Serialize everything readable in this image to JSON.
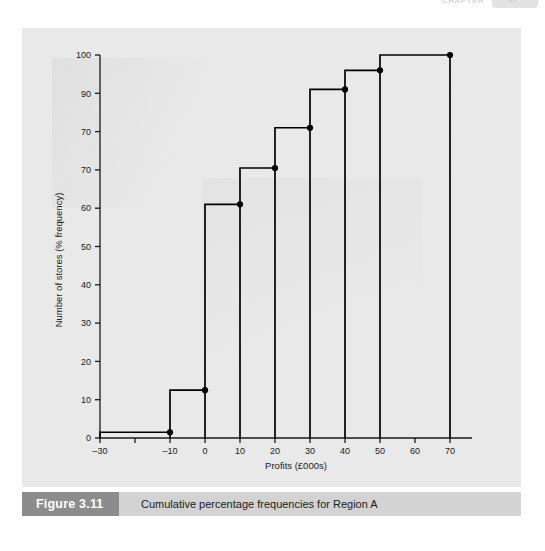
{
  "page_header": {
    "running_head": "CHAPTER",
    "page_number": "97"
  },
  "figure": {
    "badge_label": "Figure 3.11",
    "caption": "Cumulative percentage frequencies for Region A"
  },
  "chart_data": {
    "type": "line",
    "subtype": "step",
    "title": "",
    "xlabel": "Profits (£000s)",
    "ylabel": "Number of stores (% frequency)",
    "xlim": [
      -30,
      70
    ],
    "ylim": [
      0,
      100
    ],
    "xticks": [
      -30,
      -20,
      -10,
      0,
      10,
      20,
      30,
      40,
      50,
      60,
      70
    ],
    "xticklabels": [
      "–30",
      "",
      "–10",
      "0",
      "10",
      "20",
      "30",
      "40",
      "50",
      "60",
      "70"
    ],
    "yticks": [
      0,
      10,
      20,
      30,
      40,
      50,
      60,
      70,
      80,
      90,
      100
    ],
    "yticklabels": [
      "0",
      "10",
      "20",
      "30",
      "40",
      "50",
      "60",
      "70",
      "70",
      "90",
      "100"
    ],
    "grid": false,
    "legend": null,
    "line_color": "#000000",
    "marker": "circle",
    "marker_color": "#000000",
    "steps": [
      {
        "x_start": -30,
        "x_end": -10,
        "y": 1.5
      },
      {
        "x_start": -10,
        "x_end": 0,
        "y": 12.5
      },
      {
        "x_start": 0,
        "x_end": 10,
        "y": 61
      },
      {
        "x_start": 10,
        "x_end": 20,
        "y": 70.5
      },
      {
        "x_start": 20,
        "x_end": 30,
        "y": 81
      },
      {
        "x_start": 30,
        "x_end": 40,
        "y": 91
      },
      {
        "x_start": 40,
        "x_end": 50,
        "y": 96
      },
      {
        "x_start": 50,
        "x_end": 70,
        "y": 100
      }
    ],
    "points": [
      {
        "x": -10,
        "y": 1.5
      },
      {
        "x": 0,
        "y": 12.5
      },
      {
        "x": 10,
        "y": 61
      },
      {
        "x": 20,
        "y": 70.5
      },
      {
        "x": 30,
        "y": 81
      },
      {
        "x": 40,
        "y": 91
      },
      {
        "x": 50,
        "y": 96
      },
      {
        "x": 70,
        "y": 100
      }
    ]
  }
}
